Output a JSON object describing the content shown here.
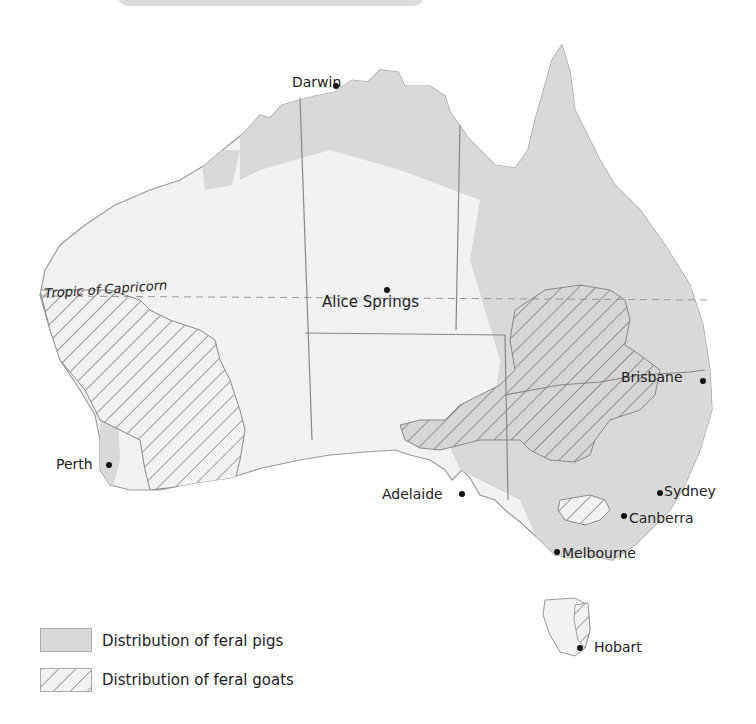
{
  "map": {
    "type": "thematic map",
    "region": "Australia",
    "reference_line": "Tropic of Capricorn",
    "colors": {
      "land": "#f2f2f2",
      "pig_fill": "#d9d9d9",
      "goat_hatch": "#666666",
      "border": "#8a8a8a"
    },
    "cities": [
      {
        "name": "Darwin"
      },
      {
        "name": "Alice Springs"
      },
      {
        "name": "Brisbane"
      },
      {
        "name": "Perth"
      },
      {
        "name": "Adelaide"
      },
      {
        "name": "Sydney"
      },
      {
        "name": "Canberra"
      },
      {
        "name": "Melbourne"
      },
      {
        "name": "Hobart"
      }
    ]
  },
  "legend": {
    "items": [
      {
        "label": "Distribution of feral pigs",
        "pattern": "solid-grey"
      },
      {
        "label": "Distribution of feral goats",
        "pattern": "diagonal-hatch"
      }
    ]
  }
}
